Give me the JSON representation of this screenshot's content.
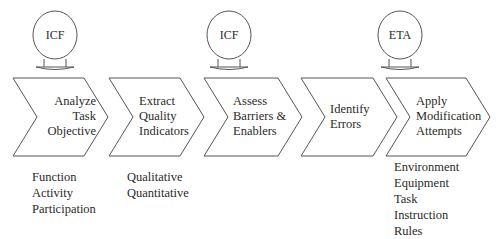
{
  "diagram": {
    "type": "process-flow",
    "bubbles": [
      {
        "label": "ICF",
        "attached_to_step": 0
      },
      {
        "label": "ICF",
        "attached_to_step": 2
      },
      {
        "label": "ETA",
        "attached_to_step": 4
      }
    ],
    "steps": [
      {
        "label": "Analyze\nTask\nObjective",
        "details": [
          "Function",
          "Activity",
          "Participation"
        ]
      },
      {
        "label": "Extract\nQuality\nIndicators",
        "details": [
          "Qualitative",
          "Quantitative"
        ]
      },
      {
        "label": "Assess\nBarriers  &\nEnablers",
        "details": []
      },
      {
        "label": "Identify\nErrors",
        "details": []
      },
      {
        "label": "Apply\nModification\nAttempts",
        "details": [
          "Environment",
          "Equipment",
          "Task",
          "Instruction",
          "Rules"
        ]
      }
    ],
    "colors": {
      "stroke": "#444444",
      "fill": "#ffffff",
      "text": "#2a2a2a"
    }
  }
}
